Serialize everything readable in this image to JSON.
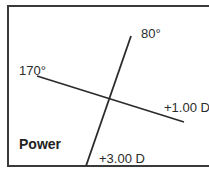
{
  "diagram": {
    "title": "Power",
    "axes": [
      {
        "angle_label": "170°",
        "power_label": "+1.00 D"
      },
      {
        "angle_label": "80°",
        "power_label": "+3.00 D"
      }
    ],
    "colors": {
      "line": "#2b2b2b",
      "border": "#3a3a3a",
      "background": "#ffffff"
    }
  }
}
